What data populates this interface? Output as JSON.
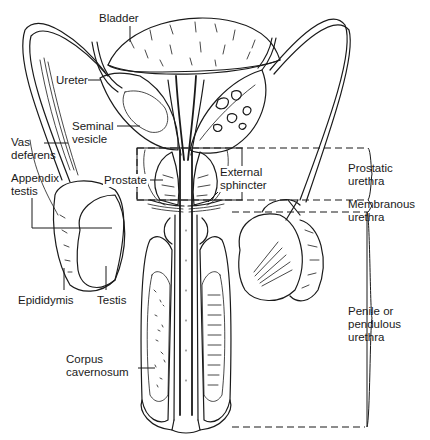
{
  "diagram": {
    "colors": {
      "ink": "#1a1a1a",
      "background": "#ffffff"
    },
    "labels": {
      "bladder": "Bladder",
      "ureter": "Ureter",
      "seminal_vesicle": "Seminal\nvesicle",
      "vas_deferens": "Vas\ndeferens",
      "appendix_testis": "Appendix\ntestis",
      "prostate": "Prostate",
      "external_sphincter": "External\nsphincter",
      "epididymis": "Epididymis",
      "testis": "Testis",
      "corpus_cavernosum": "Corpus\ncavernosum"
    },
    "urethra_segments": [
      {
        "label": "Prostatic\nurethra"
      },
      {
        "label": "Membranous\nurethra"
      },
      {
        "label": "Penile or\npendulous\nurethra"
      }
    ]
  }
}
